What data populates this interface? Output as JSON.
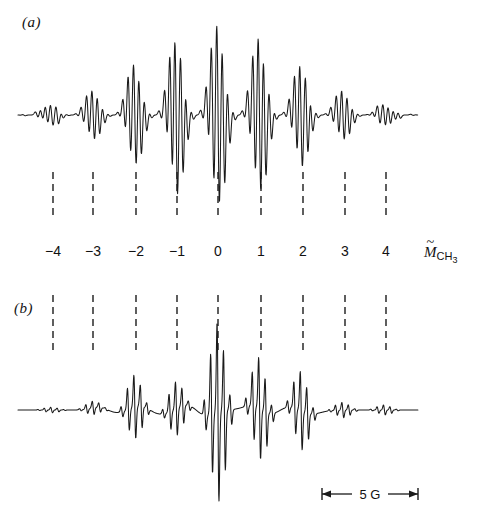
{
  "figure": {
    "background": "#ffffff",
    "trace_color": "#1a1a1a",
    "width": 480,
    "height": 519
  },
  "panels": [
    {
      "id": "a",
      "label": "(a)"
    },
    {
      "id": "b",
      "label": "(b)"
    }
  ],
  "axis": {
    "name_main": "M",
    "name_tilde": "~",
    "name_sub_text": "CH",
    "name_sub_digit": "3",
    "tick_labels": [
      "−4",
      "−3",
      "−2",
      "−1",
      "0",
      "1",
      "2",
      "3",
      "4"
    ],
    "tick_values": [
      -4,
      -3,
      -2,
      -1,
      0,
      1,
      2,
      3,
      4
    ],
    "tick_x_px": [
      53,
      93,
      136,
      177,
      218,
      261,
      303,
      345,
      386
    ]
  },
  "scale_bar": {
    "label": "5 G",
    "value": 5,
    "unit": "G",
    "x_start": 322,
    "x_end": 418,
    "y": 494
  },
  "chart_data": {
    "type": "line",
    "title": "",
    "xlabel": "M̃ CH3",
    "ylabel": "",
    "grid": false,
    "legend": "none",
    "series": [
      {
        "name": "spectrum-a",
        "description": "ESR derivative spectrum, panel (a): dense hyperfine multiplet, baseline y=115px, spans x=18 to x=418",
        "baseline_px": 115,
        "x_start": 18,
        "x_end": 418
      },
      {
        "name": "spectrum-b",
        "description": "ESR derivative spectrum, panel (b): resolved clusters of sharp lines, baseline y=410px, spans x=18 to x=418",
        "baseline_px": 410,
        "x_start": 18,
        "x_end": 418
      }
    ]
  }
}
